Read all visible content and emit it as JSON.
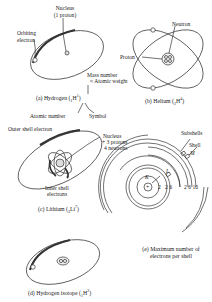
{
  "panels": {
    "a": {
      "caption_prefix": "(a) Hydrogen (",
      "caption_sub": "1",
      "caption_sym": "H",
      "caption_sup": "1",
      "caption_suffix": ")",
      "labels": {
        "nucleus": "Nucleus",
        "nucleus_detail": "(1 proton)",
        "orbiting_1": "Orbiting",
        "orbiting_2": "electron",
        "mass_number": "Mass number",
        "atomic_weight": "≈ Atomic weight",
        "atomic_number": "Atomic number",
        "symbol": "Symbol"
      }
    },
    "b": {
      "caption_prefix": "(b) Helium (",
      "caption_sub": "2",
      "caption_sym": "H",
      "caption_sup": "4",
      "caption_suffix": ")",
      "labels": {
        "neutron": "Neutron",
        "proton": "Proton"
      }
    },
    "c": {
      "caption_prefix": "(c) Lithium (",
      "caption_sub": "3",
      "caption_sym": "Li",
      "caption_sup": "7",
      "caption_suffix": ")",
      "labels": {
        "outer_shell": "Outer shell electron",
        "nucleus": "Nucleus",
        "protons": "+ 3 protons",
        "neutrons": "4 neutrons",
        "inner_1": "Inner shell",
        "inner_2": "electrons"
      }
    },
    "d": {
      "caption_prefix": "(d) Hydrogen isotope (",
      "caption_sub": "1",
      "caption_sym": "H",
      "caption_sup": "2",
      "caption_suffix": ")"
    },
    "e": {
      "caption_1": "(e) Maximum number of",
      "caption_2": "electrons per shell",
      "labels": {
        "subshells": "Subshells",
        "shell": "Shell",
        "M": "M",
        "L": "L",
        "K": "K",
        "nucleus_sign": "+",
        "k_count": "2",
        "l_counts": "2 6",
        "m_counts": "2 6 10"
      }
    }
  },
  "colors": {
    "ink": "#222222",
    "background": "#ffffff"
  }
}
